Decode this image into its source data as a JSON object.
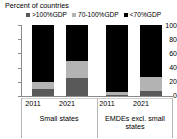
{
  "chart_data": {
    "type": "bar",
    "subtype": "stacked-bar-100",
    "title": "Percent of countries",
    "xlabel": "",
    "ylabel": "",
    "ylim": [
      0,
      100
    ],
    "yticks": [
      0,
      20,
      40,
      60,
      80,
      100
    ],
    "grid": false,
    "legend_position": "top",
    "categories": [
      "2011",
      "2021",
      "2011",
      "2021"
    ],
    "groups": [
      {
        "label": "Small states",
        "categories": [
          "2011",
          "2021"
        ]
      },
      {
        "label": "EMDEs excl. small states",
        "categories": [
          "2011",
          "2021"
        ]
      }
    ],
    "series": [
      {
        "name": ">100%GDP",
        "color": "#595959",
        "values": [
          10,
          25,
          2,
          7
        ]
      },
      {
        "name": "70-100%GDP",
        "color": "#b3b3b3",
        "values": [
          10,
          25,
          3,
          20
        ]
      },
      {
        "name": "<70%GDP",
        "color": "#000000",
        "values": [
          80,
          50,
          95,
          73
        ]
      }
    ]
  },
  "legend": {
    "items": [
      {
        "label": ">100%GDP",
        "color": "#595959"
      },
      {
        "label": "70-100%GDP",
        "color": "#b3b3b3"
      },
      {
        "label": "<70%GDP",
        "color": "#000000"
      }
    ]
  },
  "axis": {
    "y_tick_labels": [
      "100",
      "80",
      "60",
      "40",
      "20",
      "0"
    ]
  },
  "colors": {
    "axis": "#8a8a8a",
    "separator": "#b6b6b6",
    "text": "#000000"
  }
}
